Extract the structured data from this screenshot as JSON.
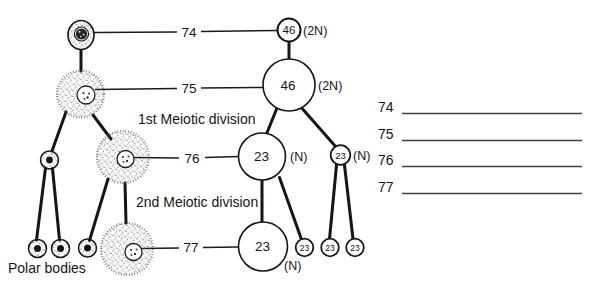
{
  "diagram": {
    "division1_label": "1st Meiotic division",
    "division2_label": "2nd Meiotic division",
    "polar_bodies_label": "Polar bodies",
    "pointer_74": "74",
    "pointer_75": "75",
    "pointer_76": "76",
    "pointer_77": "77",
    "cell_46_small": "46",
    "cell_46_small_ploidy": "(2N)",
    "cell_46_large": "46",
    "cell_46_large_ploidy": "(2N)",
    "cell_23_large1": "23",
    "cell_23_large1_ploidy": "(N)",
    "cell_23_small1": "23",
    "cell_23_small1_ploidy": "(N)",
    "cell_23_large2": "23",
    "cell_23_large2_ploidy": "(N)",
    "cell_23_small2": "23",
    "cell_23_small3": "23",
    "cell_23_small4": "23"
  },
  "answer_list": {
    "items": [
      {
        "number": "74"
      },
      {
        "number": "75"
      },
      {
        "number": "76"
      },
      {
        "number": "77"
      }
    ]
  },
  "colors": {
    "ink": "#151515",
    "blank_line": "#3d3d3d"
  }
}
